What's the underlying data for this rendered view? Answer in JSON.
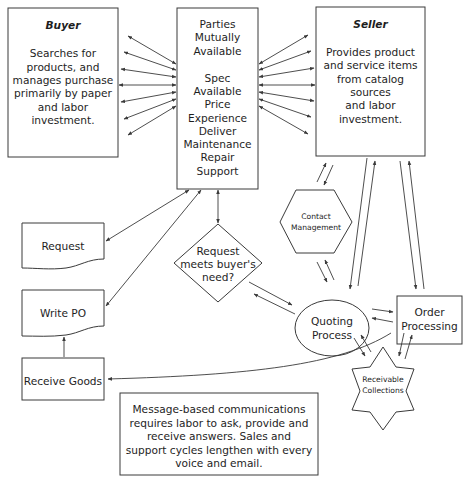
{
  "diagram": {
    "colors": {
      "stroke": "#3a3a3a",
      "text": "#1e1e1e",
      "background": "#ffffff"
    },
    "nodes": {
      "buyer": {
        "title": "Buyer",
        "lines": [
          "Searches for",
          "products, and",
          "manages purchase",
          "primarily by paper",
          "and labor",
          "investment."
        ]
      },
      "center": {
        "lines": [
          "Parties",
          "Mutually",
          "Available",
          "",
          "Spec",
          "Available",
          "Price",
          "Experience",
          "Deliver",
          "Maintenance",
          "Repair",
          "Support"
        ]
      },
      "seller": {
        "title": "Seller",
        "lines": [
          "Provides product",
          "and service items",
          "from catalog",
          "sources",
          "and labor",
          "investment."
        ]
      },
      "request": {
        "label": "Request"
      },
      "write_po": {
        "label": "Write PO"
      },
      "receive_goods": {
        "label": "Receive Goods"
      },
      "decision": {
        "lines": [
          "Request",
          "meets buyer's",
          "need?"
        ]
      },
      "contact_management": {
        "lines": [
          "Contact",
          "Management"
        ]
      },
      "quoting_process": {
        "lines": [
          "Quoting",
          "Process"
        ]
      },
      "order_processing": {
        "lines": [
          "Order",
          "Processing"
        ]
      },
      "receivable_collections": {
        "lines": [
          "Receivable",
          "Collections"
        ]
      },
      "note": {
        "lines": [
          "Message-based communications",
          "requires labor to ask, provide and",
          "receive answers.  Sales and",
          "support cycles lengthen with every",
          "voice and email."
        ]
      }
    },
    "edges": [
      {
        "from": "buyer",
        "to": "center",
        "count": 7,
        "type": "bidirectional"
      },
      {
        "from": "center",
        "to": "seller",
        "count": 7,
        "type": "bidirectional"
      },
      {
        "from": "center",
        "to": "request",
        "type": "bidirectional"
      },
      {
        "from": "center",
        "to": "write_po",
        "type": "bidirectional"
      },
      {
        "from": "center",
        "to": "decision",
        "type": "bidirectional"
      },
      {
        "from": "receive_goods",
        "to": "write_po",
        "type": "directed"
      },
      {
        "from": "decision",
        "to": "quoting_process",
        "type": "pair"
      },
      {
        "from": "seller",
        "to": "contact_management",
        "type": "pair"
      },
      {
        "from": "contact_management",
        "to": "quoting_process",
        "type": "pair"
      },
      {
        "from": "seller",
        "to": "quoting_process",
        "type": "pair"
      },
      {
        "from": "seller",
        "to": "order_processing",
        "type": "pair"
      },
      {
        "from": "quoting_process",
        "to": "order_processing",
        "type": "pair"
      },
      {
        "from": "quoting_process",
        "to": "receivable_collections",
        "type": "pair"
      },
      {
        "from": "order_processing",
        "to": "receivable_collections",
        "type": "pair"
      },
      {
        "from": "order_processing",
        "to": "receive_goods",
        "type": "directed"
      }
    ]
  }
}
